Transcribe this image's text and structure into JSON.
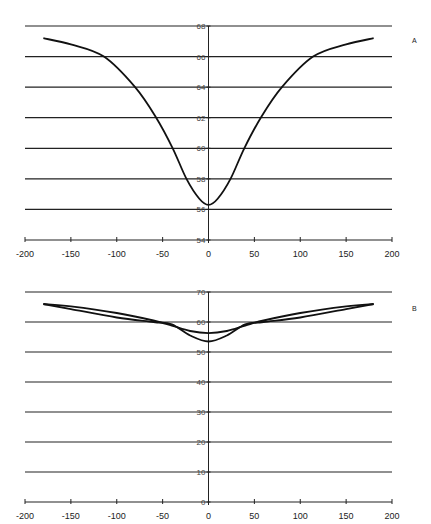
{
  "chart_data": [
    {
      "panel_label": "A",
      "type": "line",
      "title": "",
      "xlabel": "",
      "ylabel": "",
      "xlim": [
        -200,
        200
      ],
      "ylim": [
        54,
        68
      ],
      "grid": "horizontal",
      "x_ticks": [
        "-200",
        "-150",
        "-100",
        "-50",
        "0",
        "50",
        "100",
        "150",
        "200"
      ],
      "y_ticks": [
        "54",
        "56",
        "58",
        "60",
        "62",
        "64",
        "66",
        "68"
      ],
      "series": [
        {
          "name": "curve",
          "x": [
            -180,
            -150,
            -114,
            -80,
            -57,
            -39,
            -24,
            -10,
            0,
            10,
            24,
            39,
            57,
            80,
            114,
            150,
            180
          ],
          "values": [
            67.2,
            66.8,
            66.0,
            64.0,
            62.0,
            60.0,
            58.0,
            56.7,
            56.3,
            56.7,
            58.0,
            60.0,
            62.0,
            64.0,
            66.0,
            66.8,
            67.2
          ]
        }
      ]
    },
    {
      "panel_label": "B",
      "type": "line",
      "title": "",
      "xlabel": "",
      "ylabel": "",
      "xlim": [
        -200,
        200
      ],
      "ylim": [
        0,
        70
      ],
      "grid": "horizontal",
      "x_ticks": [
        "-200",
        "-150",
        "-100",
        "-50",
        "0",
        "50",
        "100",
        "150",
        "200"
      ],
      "y_ticks": [
        "0",
        "10",
        "20",
        "30",
        "40",
        "50",
        "60",
        "70"
      ],
      "series": [
        {
          "name": "curve-shallow",
          "x": [
            -180,
            -150,
            -100,
            -60,
            -40,
            -20,
            0,
            20,
            40,
            60,
            100,
            150,
            180
          ],
          "values": [
            66.0,
            65.2,
            63.0,
            60.5,
            58.8,
            57.0,
            56.3,
            57.0,
            58.8,
            60.5,
            63.0,
            65.2,
            66.0
          ]
        },
        {
          "name": "curve-deep",
          "x": [
            -180,
            -150,
            -100,
            -60,
            -40,
            -20,
            0,
            20,
            40,
            60,
            100,
            150,
            180
          ],
          "values": [
            66.0,
            64.3,
            61.5,
            60.0,
            59.2,
            55.5,
            53.5,
            55.5,
            59.2,
            60.0,
            61.5,
            64.3,
            66.0
          ]
        }
      ]
    }
  ]
}
